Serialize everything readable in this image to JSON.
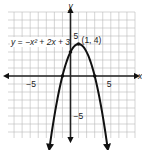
{
  "chart_data": {
    "type": "line",
    "title": "",
    "equation_label": "y = −x² + 2x + 3",
    "xlabel": "x",
    "ylabel": "y",
    "xlim": [
      -7.75,
      8
    ],
    "ylim": [
      -7.75,
      8
    ],
    "grid": true,
    "x_ticks": [
      {
        "value": -5,
        "label": "−5"
      },
      {
        "value": 5,
        "label": "5"
      }
    ],
    "y_ticks": [
      {
        "value": 5,
        "label": "5"
      },
      {
        "value": -5,
        "label": "−5"
      }
    ],
    "series": [
      {
        "name": "y = −x² + 2x + 3",
        "function": {
          "a": -1,
          "b": 2,
          "c": 3
        },
        "domain": [
          -2.6,
          4.6
        ],
        "arrows": true
      }
    ],
    "points": [
      {
        "x": -1,
        "y": 0,
        "label": ""
      },
      {
        "x": 0,
        "y": 3,
        "label": ""
      },
      {
        "x": 1,
        "y": 4,
        "label": "(1, 4)"
      },
      {
        "x": 3,
        "y": 0,
        "label": ""
      }
    ],
    "annotations": [
      {
        "text": "(1, 4)",
        "x": 1,
        "y": 4
      }
    ]
  }
}
